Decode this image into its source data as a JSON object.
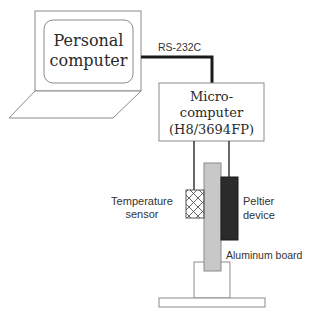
{
  "diagram": {
    "personal_computer": {
      "line1": "Personal",
      "line2": "computer"
    },
    "cable_label": "RS-232C",
    "microcomputer": {
      "line1": "Micro-",
      "line2": "computer",
      "line3": "(H8/3694FP)"
    },
    "temperature_sensor": {
      "line1": "Temperature",
      "line2": "sensor"
    },
    "peltier_device": {
      "line1": "Peltier",
      "line2": "device"
    },
    "aluminum_board": "Aluminum board"
  },
  "colors": {
    "outline": "#8a8a8a",
    "cable": "#1a1a1a",
    "aluminum": "#c8c8c8",
    "peltier": "#2b2b2b"
  }
}
